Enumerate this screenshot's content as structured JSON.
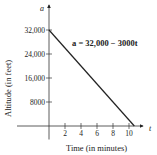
{
  "chart_data": {
    "type": "line",
    "title": "",
    "xlabel": "Time (in minutes)",
    "ylabel": "Altitude (in feet)",
    "x_var": "t",
    "y_var": "a",
    "annotation": "a = 32,000 − 3000t",
    "xlim": [
      -4,
      12
    ],
    "ylim": [
      -3500,
      34000
    ],
    "x_ticks": [
      2,
      4,
      6,
      8,
      10
    ],
    "x_tick_labels": [
      "2",
      "4",
      "6",
      "8",
      "10"
    ],
    "y_ticks": [
      8000,
      16000,
      24000,
      32000
    ],
    "y_tick_labels": [
      "8000",
      "16,000",
      "24,000",
      "32,000"
    ],
    "grid": false,
    "legend": "none",
    "series": [
      {
        "name": "a = 32,000 − 3000t",
        "x": [
          0,
          10.667
        ],
        "y": [
          32000,
          0
        ],
        "color": "#222222"
      }
    ]
  }
}
